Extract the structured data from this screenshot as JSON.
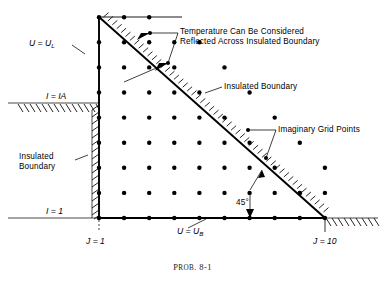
{
  "figure": {
    "caption_prefix": "P",
    "caption_smallcaps": "ROB",
    "caption_rest": ". 8-1",
    "caption_full": "Prob. 8-1"
  },
  "labels": {
    "u_left": "U = U",
    "u_left_sub": "L",
    "u_bottom": "U = U",
    "u_bottom_sub": "B",
    "i_ia": "I = IA",
    "i_1": "I = 1",
    "j_1": "J = 1",
    "j_10": "J = 10",
    "angle": "45°",
    "insulated_boundary_left_line1": "Insulated",
    "insulated_boundary_left_line2": "Boundary",
    "insulated_boundary_diag": "Insulated Boundary",
    "imaginary_grid_points": "Imaginary Grid Points",
    "reflected_line1": "Temperature Can Be Considered",
    "reflected_line2": "Reflected Across Insulated Boundary"
  },
  "colors": {
    "ink": "#000000",
    "paper": "#ffffff",
    "thin": "#1a1a1a"
  },
  "geometry": {
    "note": "grid in px of the 385x287 canvas",
    "origin_x": 99,
    "origin_y": 218,
    "top_y": 17,
    "step": 25.1,
    "j_count": 10,
    "i_rows": 9,
    "i_ia_y": 103,
    "apex_x": 99,
    "apex_y": 17,
    "right_x": 325
  },
  "chart_data": {
    "type": "scatter",
    "title": "Prob. 8-1",
    "xlabel": "J",
    "ylabel": "I",
    "grid": false,
    "legend": null,
    "xlim": [
      1,
      10
    ],
    "ylim": [
      1,
      10
    ],
    "series": [
      {
        "name": "Interior Grid Points",
        "description": "Nodes inside the 45-degree triangular region bounded by J=1 on the left, I=1 on the bottom, and the 45-degree insulated hypotenuse",
        "points": [
          [
            1,
            1
          ],
          [
            2,
            1
          ],
          [
            3,
            1
          ],
          [
            4,
            1
          ],
          [
            5,
            1
          ],
          [
            6,
            1
          ],
          [
            7,
            1
          ],
          [
            8,
            1
          ],
          [
            9,
            1
          ],
          [
            10,
            1
          ],
          [
            1,
            2
          ],
          [
            2,
            2
          ],
          [
            3,
            2
          ],
          [
            4,
            2
          ],
          [
            5,
            2
          ],
          [
            6,
            2
          ],
          [
            7,
            2
          ],
          [
            8,
            2
          ],
          [
            9,
            2
          ],
          [
            1,
            3
          ],
          [
            2,
            3
          ],
          [
            3,
            3
          ],
          [
            4,
            3
          ],
          [
            5,
            3
          ],
          [
            6,
            3
          ],
          [
            7,
            3
          ],
          [
            8,
            3
          ],
          [
            1,
            4
          ],
          [
            2,
            4
          ],
          [
            3,
            4
          ],
          [
            4,
            4
          ],
          [
            5,
            4
          ],
          [
            6,
            4
          ],
          [
            7,
            4
          ],
          [
            1,
            5
          ],
          [
            2,
            5
          ],
          [
            3,
            5
          ],
          [
            4,
            5
          ],
          [
            5,
            5
          ],
          [
            6,
            5
          ],
          [
            1,
            6
          ],
          [
            2,
            6
          ],
          [
            3,
            6
          ],
          [
            4,
            6
          ],
          [
            5,
            6
          ],
          [
            1,
            7
          ],
          [
            2,
            7
          ],
          [
            3,
            7
          ],
          [
            4,
            7
          ],
          [
            1,
            8
          ],
          [
            2,
            8
          ],
          [
            3,
            8
          ],
          [
            1,
            9
          ],
          [
            2,
            9
          ],
          [
            1,
            10
          ]
        ]
      },
      {
        "name": "Imaginary Grid Points",
        "description": "Reflected (fictitious) nodes lying outside the insulated 45-degree boundary",
        "points": [
          [
            3,
            9
          ],
          [
            4,
            8
          ],
          [
            5,
            8
          ],
          [
            6,
            7
          ],
          [
            7,
            6
          ],
          [
            8,
            5
          ],
          [
            9,
            4
          ],
          [
            10,
            3
          ],
          [
            9,
            2
          ],
          [
            10,
            2
          ]
        ]
      }
    ],
    "annotations": [
      {
        "text": "U = UL",
        "at": [
          1,
          8
        ],
        "type": "boundary-condition"
      },
      {
        "text": "U = UB",
        "at": [
          5,
          1
        ],
        "type": "boundary-condition"
      },
      {
        "text": "I = IA",
        "at": [
          1,
          5.6
        ],
        "type": "axis-marker"
      },
      {
        "text": "I = 1",
        "at": [
          0.2,
          1
        ],
        "type": "axis-marker"
      },
      {
        "text": "J = 1",
        "at": [
          1,
          0.2
        ],
        "type": "axis-marker"
      },
      {
        "text": "J = 10",
        "at": [
          10,
          0.2
        ],
        "type": "axis-marker"
      },
      {
        "text": "45°",
        "at": [
          7,
          2
        ],
        "type": "angle"
      },
      {
        "text": "Insulated Boundary",
        "at": [
          1,
          4
        ],
        "type": "callout-left"
      },
      {
        "text": "Insulated Boundary",
        "at": [
          6.5,
          6
        ],
        "type": "callout-diagonal"
      },
      {
        "text": "Imaginary Grid Points",
        "at": [
          9,
          5
        ],
        "type": "callout"
      },
      {
        "text": "Temperature Can Be Considered Reflected Across Insulated Boundary",
        "at": [
          5,
          9.5
        ],
        "type": "callout"
      }
    ]
  }
}
